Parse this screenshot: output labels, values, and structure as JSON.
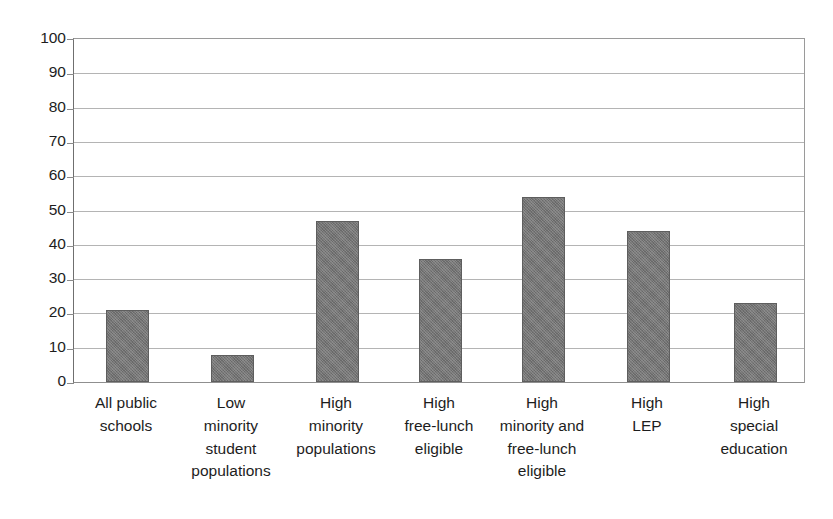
{
  "chart_data": {
    "type": "bar",
    "title": "",
    "subtitle": "",
    "xlabel": "",
    "ylabel": "",
    "ylim": [
      0,
      100
    ],
    "ytick_step": 10,
    "grid": true,
    "legend": "none",
    "orientation": "vertical",
    "bar_color": "#757575",
    "bar_edge_color": "#5e5e5e",
    "gridline_color": "#b4b4b4",
    "axis_color": "#6f6f6f",
    "background": "#ffffff",
    "yticks": [
      "100",
      "90",
      "80",
      "70",
      "60",
      "50",
      "40",
      "30",
      "20",
      "10",
      "0"
    ],
    "ytick_values": [
      100,
      90,
      80,
      70,
      60,
      50,
      40,
      30,
      20,
      10,
      0
    ],
    "categories": [
      "All public schools",
      "Low minority student populations",
      "High minority populations",
      "High free-lunch eligible",
      "High minority and free-lunch eligible",
      "High LEP",
      "High special education"
    ],
    "category_label_lines": [
      [
        "All public",
        "schools"
      ],
      [
        "Low",
        "minority",
        "student",
        "populations"
      ],
      [
        "High",
        "minority",
        "populations"
      ],
      [
        "High",
        "free-lunch",
        "eligible"
      ],
      [
        "High",
        "minority and",
        "free-lunch",
        "eligible"
      ],
      [
        "High",
        "LEP"
      ],
      [
        "High",
        "special",
        "education"
      ]
    ],
    "values": [
      21,
      8,
      47,
      36,
      54,
      44,
      23
    ]
  }
}
